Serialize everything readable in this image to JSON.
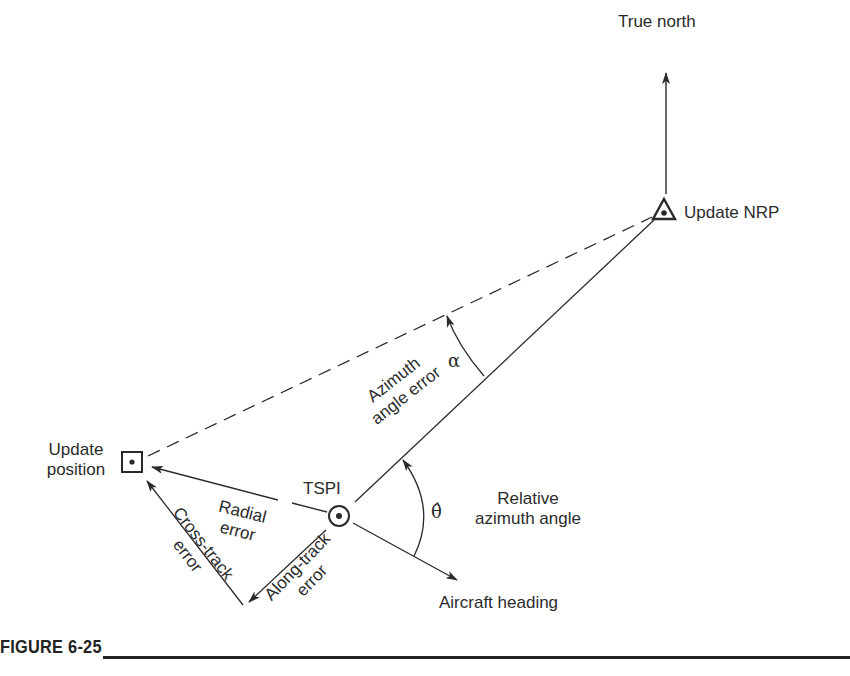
{
  "figure": {
    "caption": "FIGURE 6-25",
    "accent_color": "#2a2a2a"
  },
  "labels": {
    "true_north": "True north",
    "update_nrp": "Update NRP",
    "update_position_line1": "Update",
    "update_position_line2": "position",
    "tspi": "TSPI",
    "radial_error_line1": "Radial",
    "radial_error_line2": "error",
    "cross_track_line1": "Cross-track",
    "cross_track_line2": "error",
    "along_track_line1": "Along-track",
    "along_track_line2": "error",
    "azimuth_error_line1": "Azimuth",
    "azimuth_error_line2": "angle error",
    "alpha": "α",
    "theta_hat": "θ̂",
    "relative_azimuth_line1": "Relative",
    "relative_azimuth_line2": "azimuth angle",
    "aircraft_heading": "Aircraft heading"
  },
  "points": {
    "update_nrp": [
      664,
      212
    ],
    "tspi": [
      339,
      516
    ],
    "update_position": [
      132,
      462
    ],
    "north_tip": [
      666,
      72
    ],
    "heading_tip": [
      458,
      580
    ],
    "along_track_tip": [
      248,
      603
    ]
  }
}
